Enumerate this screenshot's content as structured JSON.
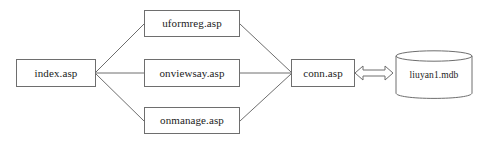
{
  "diagram": {
    "background_color": "#ffffff",
    "stroke_color": "#6e6e6e",
    "text_color": "#1b1b1b",
    "nodes": [
      {
        "id": "index",
        "label": "index.asp",
        "shape": "rectangle"
      },
      {
        "id": "uformreg",
        "label": "uformreg.asp",
        "shape": "rectangle"
      },
      {
        "id": "onviewsay",
        "label": "onviewsay.asp",
        "shape": "rectangle"
      },
      {
        "id": "onmanage",
        "label": "onmanage.asp",
        "shape": "rectangle"
      },
      {
        "id": "conn",
        "label": "conn.asp",
        "shape": "rectangle"
      },
      {
        "id": "database",
        "label": "liuyan1.mdb",
        "shape": "cylinder"
      }
    ],
    "edges": [
      {
        "from": "index",
        "to": "uformreg",
        "style": "line",
        "arrow": "none"
      },
      {
        "from": "index",
        "to": "onviewsay",
        "style": "line",
        "arrow": "none"
      },
      {
        "from": "index",
        "to": "onmanage",
        "style": "line",
        "arrow": "none"
      },
      {
        "from": "uformreg",
        "to": "conn",
        "style": "line",
        "arrow": "none"
      },
      {
        "from": "onviewsay",
        "to": "conn",
        "style": "line",
        "arrow": "none"
      },
      {
        "from": "onmanage",
        "to": "conn",
        "style": "line",
        "arrow": "none"
      },
      {
        "from": "conn",
        "to": "database",
        "style": "block-arrow",
        "arrow": "double"
      }
    ]
  }
}
